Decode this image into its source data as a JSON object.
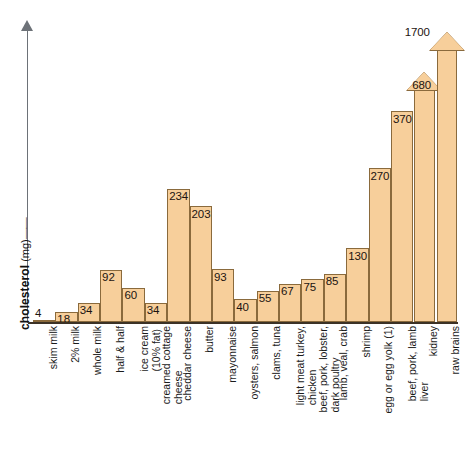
{
  "caption_remnant": "",
  "axis": {
    "y_title_bold": "cholesterol",
    "y_title_unit": " (mg)",
    "y_title_dash": "——"
  },
  "chart_data": {
    "type": "bar",
    "title": "",
    "xlabel": "",
    "ylabel": "cholesterol (mg)",
    "ylim": [
      0,
      1700
    ],
    "grid": false,
    "legend": "none",
    "units": "mg",
    "note": "Last two bars are drawn as arrows to indicate values exceeding the plot scale.",
    "categories": [
      "skim milk",
      "2% milk",
      "whole milk",
      "half & half",
      "ice cream (10% fat)",
      "creamed cottage cheese",
      "cheddar cheese",
      "butter",
      "mayonnaise",
      "oysters, salmon",
      "clams, tuna",
      "light meat turkey, chicken",
      "beef, pork, lobster, dark poultry",
      "lamb, veal, crab",
      "shrimp",
      "egg or egg yolk (1)",
      "beef, pork, lamb liver",
      "kidney",
      "raw brains"
    ],
    "category_lines": [
      [
        "skim milk"
      ],
      [
        "2% milk"
      ],
      [
        "whole milk"
      ],
      [
        "half & half"
      ],
      [
        "ice cream",
        "(10% fat)"
      ],
      [
        "creamed cottage",
        "cheese"
      ],
      [
        "cheddar cheese"
      ],
      [
        "butter"
      ],
      [
        "mayonnaise"
      ],
      [
        "oysters, salmon"
      ],
      [
        "clams, tuna"
      ],
      [
        "light meat turkey,",
        "chicken"
      ],
      [
        "beef, pork, lobster,",
        "dark poultry"
      ],
      [
        "lamb, veal, crab"
      ],
      [
        "shrimp"
      ],
      [
        "egg or egg yolk (1)"
      ],
      [
        "beef, pork, lamb",
        "liver"
      ],
      [
        "kidney"
      ],
      [
        "raw brains"
      ]
    ],
    "values": [
      4,
      18,
      34,
      92,
      60,
      34,
      234,
      203,
      93,
      40,
      55,
      67,
      75,
      85,
      130,
      270,
      370,
      680,
      1700
    ],
    "value_labels": [
      "4",
      "18",
      "34",
      "92",
      "60",
      "34",
      "234",
      "203",
      "93",
      "40",
      "55",
      "67",
      "75",
      "85",
      "130",
      "270",
      "370",
      "680",
      "1700"
    ],
    "arrow_bars": [
      17,
      18
    ]
  },
  "colors": {
    "bar_fill": "#F7CF9B",
    "bar_stroke": "#8A6A3C",
    "axis": "#6D7278",
    "baseline": "#3C3226",
    "text": "#1B1B1B"
  }
}
